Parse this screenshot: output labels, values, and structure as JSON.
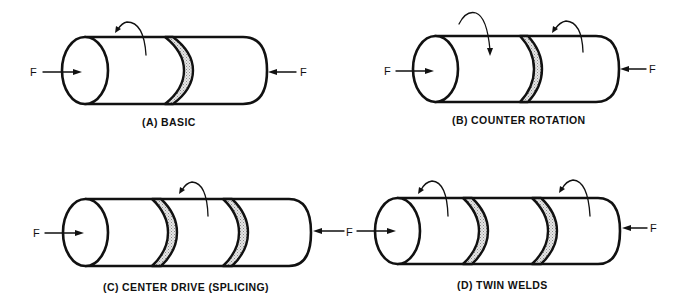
{
  "figure": {
    "type": "friction welding configurations",
    "force_label": "F",
    "panels": [
      {
        "id": "A",
        "caption": "(A)  BASIC",
        "rotation_arrows": 1,
        "welds": 1
      },
      {
        "id": "B",
        "caption": "(B)  COUNTER ROTATION",
        "rotation_arrows": 2,
        "welds": 1
      },
      {
        "id": "C",
        "caption": "(C)  CENTER DRIVE (SPLICING)",
        "rotation_arrows": 1,
        "welds": 2
      },
      {
        "id": "D",
        "caption": "(D)  TWIN WELDS",
        "rotation_arrows": 2,
        "welds": 2
      }
    ]
  },
  "colors": {
    "line": "#111111",
    "weld_fill": "#c8c8c8",
    "background": "#ffffff"
  }
}
